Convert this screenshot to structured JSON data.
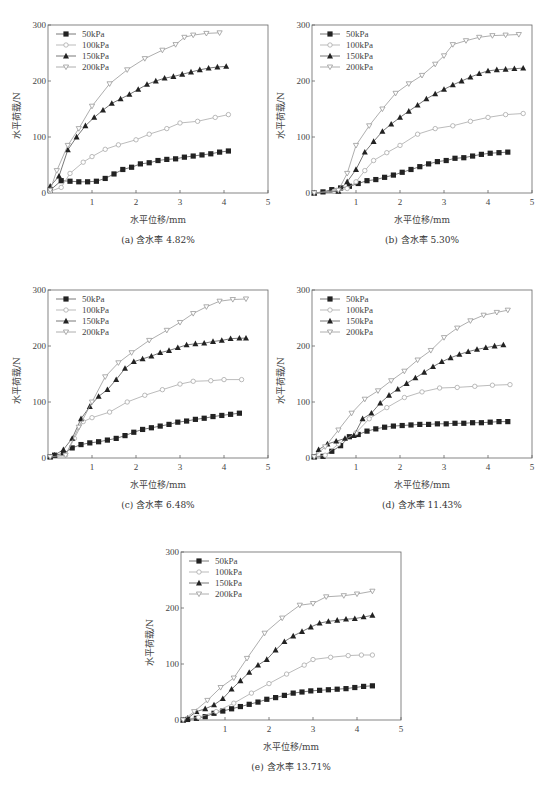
{
  "figure": {
    "bottom_caption": ""
  },
  "chart_data": [
    {
      "type": "line",
      "panel": "a",
      "caption": "(a) 含水率 4.82%",
      "xlabel": "水平位移/mm",
      "ylabel": "水平荷载/N",
      "xlim": [
        0,
        5
      ],
      "ylim": [
        0,
        300
      ],
      "xticks": [
        "1",
        "2",
        "3",
        "4",
        "5"
      ],
      "yticks": [
        "0",
        "100",
        "200",
        "300"
      ],
      "grid": false,
      "legend": {
        "position": "upper-left",
        "entries": [
          "50kPa",
          "100kPa",
          "150kPa",
          "200kPa"
        ]
      },
      "series": [
        {
          "name": "50kPa",
          "marker": "square-filled",
          "color": "#222222",
          "x": [
            0.05,
            0.3,
            0.5,
            0.7,
            0.9,
            1.1,
            1.3,
            1.5,
            1.7,
            1.9,
            2.1,
            2.3,
            2.5,
            2.7,
            2.9,
            3.1,
            3.3,
            3.5,
            3.7,
            3.9,
            4.1
          ],
          "y": [
            5,
            22,
            21,
            20,
            20,
            21,
            26,
            34,
            42,
            46,
            52,
            54,
            58,
            60,
            61,
            64,
            66,
            68,
            70,
            73,
            75
          ]
        },
        {
          "name": "100kPa",
          "marker": "circle-open",
          "color": "#aaaaaa",
          "x": [
            0.05,
            0.3,
            0.5,
            0.8,
            1.0,
            1.3,
            1.6,
            2.0,
            2.3,
            2.7,
            3.0,
            3.4,
            3.8,
            4.1
          ],
          "y": [
            3,
            10,
            35,
            55,
            65,
            78,
            86,
            95,
            105,
            115,
            125,
            128,
            135,
            140
          ]
        },
        {
          "name": "150kPa",
          "marker": "triangle-up-filled",
          "color": "#222222",
          "x": [
            0.05,
            0.25,
            0.45,
            0.65,
            0.85,
            1.05,
            1.25,
            1.45,
            1.65,
            1.85,
            2.05,
            2.25,
            2.45,
            2.65,
            2.85,
            3.05,
            3.25,
            3.45,
            3.65,
            3.85,
            4.05
          ],
          "y": [
            12,
            30,
            77,
            100,
            120,
            135,
            148,
            160,
            168,
            176,
            185,
            194,
            200,
            205,
            208,
            212,
            216,
            220,
            223,
            225,
            226
          ]
        },
        {
          "name": "200kPa",
          "marker": "triangle-down-open",
          "color": "#999999",
          "x": [
            0.05,
            0.2,
            0.45,
            0.7,
            1.0,
            1.4,
            1.8,
            2.2,
            2.6,
            2.9,
            3.1,
            3.3,
            3.6,
            3.9
          ],
          "y": [
            5,
            40,
            85,
            115,
            155,
            195,
            220,
            240,
            255,
            265,
            278,
            282,
            285,
            286
          ]
        }
      ]
    },
    {
      "type": "line",
      "panel": "b",
      "caption": "(b) 含水率 5.30%",
      "xlabel": "水平位移/mm",
      "ylabel": "水平荷载/N",
      "xlim": [
        0,
        5
      ],
      "ylim": [
        0,
        300
      ],
      "xticks": [
        "1",
        "2",
        "3",
        "4",
        "5"
      ],
      "yticks": [
        "0",
        "100",
        "200",
        "300"
      ],
      "grid": false,
      "legend": {
        "position": "upper-left",
        "entries": [
          "50kPa",
          "100kPa",
          "150kPa",
          "200kPa"
        ]
      },
      "series": [
        {
          "name": "50kPa",
          "marker": "square-filled",
          "color": "#222222",
          "x": [
            0.05,
            0.25,
            0.45,
            0.65,
            0.85,
            1.05,
            1.25,
            1.45,
            1.65,
            1.85,
            2.05,
            2.25,
            2.45,
            2.65,
            2.85,
            3.05,
            3.25,
            3.45,
            3.65,
            3.85,
            4.05,
            4.25,
            4.45
          ],
          "y": [
            0,
            2,
            6,
            9,
            12,
            17,
            22,
            24,
            28,
            32,
            37,
            42,
            47,
            52,
            56,
            58,
            62,
            63,
            66,
            69,
            71,
            72,
            73
          ]
        },
        {
          "name": "100kPa",
          "marker": "circle-open",
          "color": "#aaaaaa",
          "x": [
            0.05,
            0.5,
            0.8,
            1.0,
            1.2,
            1.4,
            1.7,
            2.0,
            2.4,
            2.8,
            3.2,
            3.6,
            4.0,
            4.4,
            4.8
          ],
          "y": [
            0,
            3,
            8,
            20,
            40,
            58,
            72,
            85,
            105,
            115,
            120,
            128,
            135,
            140,
            142
          ]
        },
        {
          "name": "150kPa",
          "marker": "triangle-up-filled",
          "color": "#222222",
          "x": [
            0.05,
            0.6,
            0.8,
            1.0,
            1.2,
            1.4,
            1.6,
            1.8,
            2.0,
            2.2,
            2.4,
            2.6,
            2.8,
            3.0,
            3.2,
            3.4,
            3.6,
            3.8,
            4.0,
            4.2,
            4.4,
            4.6,
            4.8
          ],
          "y": [
            0,
            3,
            20,
            42,
            73,
            92,
            110,
            123,
            135,
            146,
            157,
            168,
            177,
            185,
            193,
            200,
            207,
            213,
            218,
            220,
            221,
            222,
            223
          ]
        },
        {
          "name": "200kPa",
          "marker": "triangle-down-open",
          "color": "#999999",
          "x": [
            0.05,
            0.6,
            0.8,
            1.0,
            1.3,
            1.6,
            1.9,
            2.2,
            2.5,
            2.8,
            3.0,
            3.2,
            3.5,
            3.8,
            4.1,
            4.4,
            4.7
          ],
          "y": [
            0,
            5,
            35,
            85,
            120,
            150,
            178,
            195,
            210,
            230,
            245,
            265,
            272,
            278,
            281,
            282,
            283
          ]
        }
      ]
    },
    {
      "type": "line",
      "panel": "c",
      "caption": "(c) 含水率 6.48%",
      "xlabel": "水平位移/mm",
      "ylabel": "水平荷载/N",
      "xlim": [
        0,
        5
      ],
      "ylim": [
        0,
        300
      ],
      "xticks": [
        "1",
        "2",
        "3",
        "4",
        "5"
      ],
      "yticks": [
        "0",
        "100",
        "200",
        "300"
      ],
      "grid": false,
      "legend": {
        "position": "upper-left",
        "entries": [
          "50kPa",
          "100kPa",
          "150kPa",
          "200kPa"
        ]
      },
      "series": [
        {
          "name": "50kPa",
          "marker": "square-filled",
          "color": "#222222",
          "x": [
            0.05,
            0.15,
            0.35,
            0.55,
            0.75,
            0.95,
            1.15,
            1.35,
            1.55,
            1.75,
            1.95,
            2.15,
            2.35,
            2.55,
            2.75,
            2.95,
            3.15,
            3.35,
            3.55,
            3.75,
            3.95,
            4.15,
            4.35
          ],
          "y": [
            2,
            5,
            8,
            18,
            24,
            27,
            29,
            32,
            35,
            40,
            46,
            51,
            54,
            57,
            60,
            64,
            66,
            69,
            71,
            74,
            76,
            78,
            80
          ]
        },
        {
          "name": "100kPa",
          "marker": "circle-open",
          "color": "#aaaaaa",
          "x": [
            0.05,
            0.4,
            0.6,
            0.8,
            1.0,
            1.4,
            1.8,
            2.2,
            2.6,
            3.0,
            3.3,
            3.7,
            4.0,
            4.4
          ],
          "y": [
            2,
            5,
            35,
            65,
            72,
            82,
            100,
            112,
            122,
            132,
            137,
            138,
            140,
            140
          ]
        },
        {
          "name": "150kPa",
          "marker": "triangle-up-filled",
          "color": "#222222",
          "x": [
            0.05,
            0.15,
            0.35,
            0.55,
            0.75,
            0.95,
            1.15,
            1.35,
            1.55,
            1.75,
            1.95,
            2.15,
            2.35,
            2.55,
            2.75,
            2.95,
            3.15,
            3.35,
            3.55,
            3.75,
            3.95,
            4.15,
            4.35,
            4.5
          ],
          "y": [
            2,
            5,
            15,
            35,
            70,
            92,
            110,
            122,
            140,
            160,
            172,
            177,
            182,
            188,
            192,
            197,
            202,
            204,
            205,
            208,
            210,
            213,
            214,
            214
          ]
        },
        {
          "name": "200kPa",
          "marker": "triangle-down-open",
          "color": "#999999",
          "x": [
            0.05,
            0.4,
            0.7,
            1.0,
            1.3,
            1.6,
            1.9,
            2.3,
            2.7,
            3.0,
            3.3,
            3.6,
            3.9,
            4.2,
            4.5
          ],
          "y": [
            2,
            5,
            55,
            100,
            145,
            170,
            188,
            210,
            228,
            242,
            258,
            270,
            280,
            283,
            284
          ]
        }
      ]
    },
    {
      "type": "line",
      "panel": "d",
      "caption": "(d) 含水率 11.43%",
      "xlabel": "水平位移/mm",
      "ylabel": "水平荷载/N",
      "xlim": [
        0,
        5
      ],
      "ylim": [
        0,
        300
      ],
      "xticks": [
        "1",
        "2",
        "3",
        "4",
        "5"
      ],
      "yticks": [
        "0",
        "100",
        "200",
        "300"
      ],
      "grid": false,
      "legend": {
        "position": "upper-left",
        "entries": [
          "50kPa",
          "100kPa",
          "150kPa",
          "200kPa"
        ]
      },
      "series": [
        {
          "name": "50kPa",
          "marker": "square-filled",
          "color": "#222222",
          "x": [
            0.05,
            0.25,
            0.45,
            0.65,
            0.85,
            1.05,
            1.25,
            1.45,
            1.65,
            1.85,
            2.05,
            2.25,
            2.45,
            2.65,
            2.85,
            3.05,
            3.25,
            3.45,
            3.65,
            3.85,
            4.05,
            4.25,
            4.45
          ],
          "y": [
            2,
            3,
            12,
            22,
            38,
            42,
            48,
            52,
            55,
            57,
            58,
            59,
            60,
            60,
            61,
            61,
            62,
            62,
            63,
            63,
            64,
            65,
            65
          ]
        },
        {
          "name": "100kPa",
          "marker": "circle-open",
          "color": "#aaaaaa",
          "x": [
            0.05,
            0.3,
            0.6,
            1.0,
            1.3,
            1.7,
            2.1,
            2.5,
            2.9,
            3.3,
            3.7,
            4.1,
            4.5
          ],
          "y": [
            2,
            5,
            25,
            45,
            70,
            90,
            108,
            118,
            125,
            126,
            128,
            130,
            131
          ]
        },
        {
          "name": "150kPa",
          "marker": "triangle-up-filled",
          "color": "#222222",
          "x": [
            0.05,
            0.15,
            0.35,
            0.55,
            0.75,
            0.95,
            1.15,
            1.35,
            1.55,
            1.75,
            1.95,
            2.15,
            2.35,
            2.55,
            2.75,
            2.95,
            3.15,
            3.35,
            3.55,
            3.75,
            3.95,
            4.15,
            4.35
          ],
          "y": [
            2,
            15,
            25,
            30,
            35,
            40,
            70,
            80,
            98,
            112,
            123,
            133,
            143,
            153,
            163,
            172,
            179,
            185,
            190,
            194,
            197,
            200,
            202
          ]
        },
        {
          "name": "200kPa",
          "marker": "triangle-down-open",
          "color": "#999999",
          "x": [
            0.05,
            0.3,
            0.6,
            0.9,
            1.2,
            1.5,
            1.8,
            2.1,
            2.4,
            2.7,
            3.0,
            3.3,
            3.6,
            3.9,
            4.2,
            4.45
          ],
          "y": [
            2,
            20,
            50,
            80,
            105,
            120,
            138,
            155,
            175,
            192,
            215,
            232,
            245,
            255,
            260,
            264
          ]
        }
      ]
    },
    {
      "type": "line",
      "panel": "e",
      "caption": "(e) 含水率 13.71%",
      "xlabel": "水平位移/mm",
      "ylabel": "水平荷载/N",
      "xlim": [
        0,
        5
      ],
      "ylim": [
        0,
        300
      ],
      "xticks": [
        "1",
        "2",
        "3",
        "4",
        "5"
      ],
      "yticks": [
        "0",
        "100",
        "200",
        "300"
      ],
      "grid": false,
      "legend": {
        "position": "upper-left",
        "entries": [
          "50kPa",
          "100kPa",
          "150kPa",
          "200kPa"
        ]
      },
      "series": [
        {
          "name": "50kPa",
          "marker": "square-filled",
          "color": "#222222",
          "x": [
            0.05,
            0.15,
            0.35,
            0.55,
            0.75,
            0.95,
            1.15,
            1.35,
            1.55,
            1.75,
            1.95,
            2.15,
            2.35,
            2.55,
            2.75,
            2.95,
            3.15,
            3.35,
            3.55,
            3.75,
            3.95,
            4.15,
            4.35
          ],
          "y": [
            0,
            1,
            3,
            6,
            12,
            16,
            20,
            24,
            28,
            32,
            37,
            40,
            44,
            48,
            50,
            52,
            53,
            54,
            55,
            56,
            58,
            60,
            61
          ]
        },
        {
          "name": "100kPa",
          "marker": "circle-open",
          "color": "#aaaaaa",
          "x": [
            0.05,
            0.4,
            0.8,
            1.2,
            1.6,
            2.0,
            2.4,
            2.8,
            3.0,
            3.4,
            3.8,
            4.1,
            4.35
          ],
          "y": [
            0,
            5,
            15,
            30,
            48,
            65,
            82,
            98,
            108,
            112,
            115,
            116,
            116
          ]
        },
        {
          "name": "150kPa",
          "marker": "triangle-up-filled",
          "color": "#222222",
          "x": [
            0.05,
            0.15,
            0.35,
            0.55,
            0.75,
            0.95,
            1.15,
            1.35,
            1.55,
            1.75,
            1.95,
            2.15,
            2.35,
            2.55,
            2.75,
            2.95,
            3.15,
            3.35,
            3.55,
            3.75,
            3.95,
            4.15,
            4.35
          ],
          "y": [
            0,
            3,
            15,
            20,
            27,
            38,
            55,
            70,
            85,
            98,
            108,
            125,
            140,
            150,
            158,
            166,
            173,
            176,
            178,
            180,
            181,
            184,
            187
          ]
        },
        {
          "name": "200kPa",
          "marker": "triangle-down-open",
          "color": "#999999",
          "x": [
            0.05,
            0.3,
            0.6,
            0.9,
            1.2,
            1.5,
            1.9,
            2.3,
            2.7,
            3.0,
            3.3,
            3.7,
            4.0,
            4.35
          ],
          "y": [
            0,
            15,
            35,
            58,
            75,
            110,
            155,
            182,
            205,
            208,
            220,
            222,
            225,
            230
          ]
        }
      ]
    }
  ]
}
